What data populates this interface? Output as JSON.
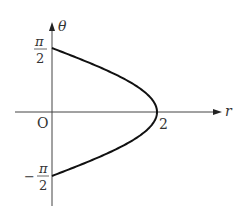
{
  "figure": {
    "axes": {
      "vertical_label": "θ",
      "horizontal_label": "r",
      "origin_label": "O"
    },
    "ticks": {
      "top": {
        "numerator": "π",
        "denominator": "2",
        "sign": ""
      },
      "bottom": {
        "numerator": "π",
        "denominator": "2",
        "sign": "−"
      },
      "r_value": "2"
    },
    "curve": {
      "equation": "r = 2cos θ",
      "theta_range": [
        "-π/2",
        "π/2"
      ],
      "r_max": 2,
      "color": "#111111"
    }
  }
}
